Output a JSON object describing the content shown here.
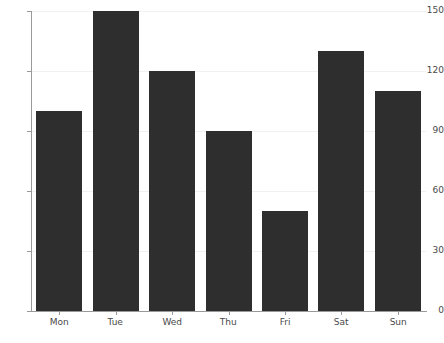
{
  "chart_data": {
    "type": "bar",
    "title": "",
    "subtitle": "",
    "xlabel": "",
    "ylabel": "",
    "categories": [
      "Mon",
      "Tue",
      "Wed",
      "Thu",
      "Fri",
      "Sat",
      "Sun"
    ],
    "values": [
      100,
      150,
      120,
      90,
      50,
      130,
      110
    ],
    "ylim": [
      0,
      150
    ],
    "yticks": [
      0,
      30,
      60,
      90,
      120,
      150
    ],
    "ytick_labels": [
      "0",
      "30",
      "60",
      "90",
      "120",
      "150"
    ],
    "grid": true,
    "grid_axis": "y",
    "legend": null,
    "legend_position": "none",
    "bar_color": "#2e2e2e",
    "grid_color": "#f1f1f1",
    "axis_color": "#9a9a9a",
    "tick_label_color": "#4a4a4a",
    "background_color": "#ffffff",
    "annotations": []
  }
}
